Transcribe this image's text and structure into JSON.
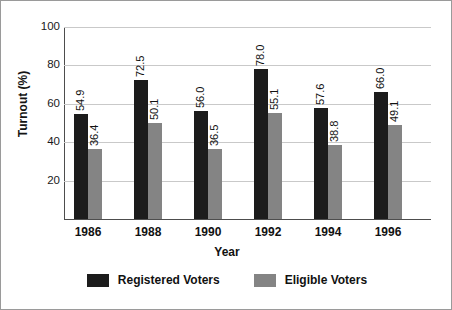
{
  "chart_data": {
    "type": "bar",
    "title": "",
    "xlabel": "Year",
    "ylabel": "Turnout (%)",
    "categories": [
      "1986",
      "1988",
      "1990",
      "1992",
      "1994",
      "1996"
    ],
    "series": [
      {
        "name": "Registered Voters",
        "color": "#1c1c1c",
        "values": [
          54.9,
          72.5,
          56.0,
          78.0,
          57.6,
          66.0
        ],
        "labels": [
          "54.9",
          "72.5",
          "56.0",
          "78.0",
          "57.6",
          "66.0"
        ]
      },
      {
        "name": "Eligible Voters",
        "color": "#848484",
        "values": [
          36.4,
          50.1,
          36.5,
          55.1,
          38.8,
          49.1
        ],
        "labels": [
          "36.4",
          "50.1",
          "36.5",
          "55.1",
          "38.8",
          "49.1"
        ]
      }
    ],
    "ylim": [
      0,
      100
    ],
    "yticks": [
      20,
      40,
      60,
      80,
      100
    ],
    "ytick_labels": [
      "20",
      "40",
      "60",
      "80",
      "100"
    ],
    "grid": true,
    "legend_position": "bottom"
  },
  "legend": {
    "items": [
      {
        "label": "Registered Voters",
        "color": "#1c1c1c"
      },
      {
        "label": "Eligible Voters",
        "color": "#848484"
      }
    ]
  }
}
